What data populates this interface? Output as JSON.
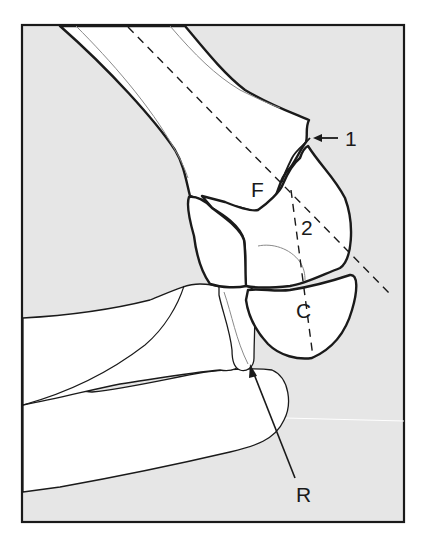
{
  "figure": {
    "type": "anatomical line drawing",
    "background_color": "#e6e6e6",
    "frame_color": "#1a1a1a",
    "bone_fill": "#ffffff"
  },
  "labels": {
    "one": "1",
    "F": "F",
    "two": "2",
    "C": "C",
    "R": "R"
  },
  "annotations": [
    {
      "label": "1",
      "pointer": "arrow pointing left to fracture line on humerus"
    },
    {
      "label": "F",
      "meaning": "fracture fragment region"
    },
    {
      "label": "2",
      "meaning": "dashed axis line of condyle"
    },
    {
      "label": "C",
      "meaning": "capitellum / condyle"
    },
    {
      "label": "R",
      "pointer": "arrow pointing up to radial head"
    }
  ]
}
